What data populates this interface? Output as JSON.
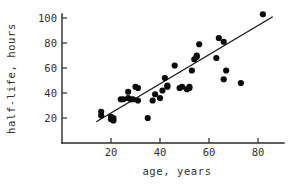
{
  "chart_data": {
    "type": "scatter",
    "title": "",
    "xlabel": "age, years",
    "ylabel": "half-life, hours",
    "xlim": [
      0,
      90
    ],
    "ylim": [
      0,
      110
    ],
    "xticks": [
      20,
      40,
      60,
      80
    ],
    "yticks": [
      20,
      40,
      60,
      80,
      100
    ],
    "grid": false,
    "legend": "none",
    "points": [
      {
        "x": 16,
        "y": 25
      },
      {
        "x": 16,
        "y": 22
      },
      {
        "x": 20,
        "y": 21
      },
      {
        "x": 20,
        "y": 19
      },
      {
        "x": 21,
        "y": 18
      },
      {
        "x": 21,
        "y": 20
      },
      {
        "x": 24,
        "y": 35
      },
      {
        "x": 25,
        "y": 35
      },
      {
        "x": 27,
        "y": 36
      },
      {
        "x": 27,
        "y": 41
      },
      {
        "x": 28,
        "y": 35
      },
      {
        "x": 29,
        "y": 35
      },
      {
        "x": 30,
        "y": 45
      },
      {
        "x": 31,
        "y": 44
      },
      {
        "x": 31,
        "y": 34
      },
      {
        "x": 35,
        "y": 20
      },
      {
        "x": 37,
        "y": 34
      },
      {
        "x": 38,
        "y": 39
      },
      {
        "x": 40,
        "y": 36
      },
      {
        "x": 41,
        "y": 42
      },
      {
        "x": 42,
        "y": 52
      },
      {
        "x": 43,
        "y": 46
      },
      {
        "x": 43,
        "y": 45
      },
      {
        "x": 46,
        "y": 62
      },
      {
        "x": 48,
        "y": 44
      },
      {
        "x": 49,
        "y": 45
      },
      {
        "x": 51,
        "y": 43
      },
      {
        "x": 52,
        "y": 45
      },
      {
        "x": 52,
        "y": 44
      },
      {
        "x": 53,
        "y": 58
      },
      {
        "x": 54,
        "y": 67
      },
      {
        "x": 55,
        "y": 69
      },
      {
        "x": 55,
        "y": 70
      },
      {
        "x": 56,
        "y": 79
      },
      {
        "x": 63,
        "y": 68
      },
      {
        "x": 64,
        "y": 84
      },
      {
        "x": 66,
        "y": 81
      },
      {
        "x": 66,
        "y": 51
      },
      {
        "x": 67,
        "y": 58
      },
      {
        "x": 73,
        "y": 48
      },
      {
        "x": 82,
        "y": 103
      }
    ],
    "fit_line": {
      "label": "regression line",
      "x_start": 14,
      "y_start": 17,
      "x_end": 86,
      "y_end": 101
    },
    "marker": {
      "shape": "filled-circle",
      "radius": 3.1,
      "color": "#0b0b0b"
    },
    "axis_color": "#2b2b2b"
  },
  "layout": {
    "plot_left": 62,
    "plot_bottom": 143,
    "plot_right": 284,
    "plot_top": 14,
    "px_per_x_unit": 2.45,
    "px_per_y_unit": 1.25,
    "x_origin_value": 0,
    "y_origin_value": 0
  }
}
